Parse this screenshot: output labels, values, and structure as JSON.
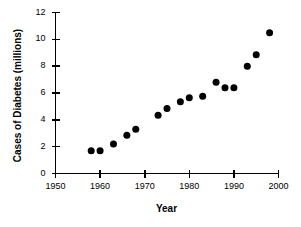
{
  "chart_data": {
    "type": "scatter",
    "title": "",
    "xlabel": "Year",
    "ylabel": "Cases of Diabetes (millions)",
    "xlim": [
      1950,
      2000
    ],
    "ylim": [
      0,
      12
    ],
    "xticks": [
      1950,
      1960,
      1970,
      1980,
      1990,
      2000
    ],
    "xticklabels": [
      "1950",
      "1960",
      "1970",
      "1980",
      "1990",
      "2000"
    ],
    "yticks": [
      0,
      2,
      4,
      6,
      8,
      10,
      12
    ],
    "yticklabels": [
      "0",
      "2",
      "4",
      "6",
      "8",
      "10",
      "12"
    ],
    "grid": false,
    "legend": null,
    "marker": {
      "shape": "circle",
      "color": "#000000",
      "size": 7
    },
    "series": [
      {
        "name": "Cases of Diabetes",
        "x": [
          1958,
          1960,
          1963,
          1966,
          1968,
          1973,
          1975,
          1978,
          1980,
          1983,
          1986,
          1988,
          1990,
          1993,
          1995,
          1998
        ],
        "y": [
          1.7,
          1.7,
          2.2,
          2.85,
          3.3,
          4.35,
          4.85,
          5.35,
          5.65,
          5.75,
          6.8,
          6.4,
          6.4,
          8.0,
          8.85,
          10.5
        ]
      }
    ]
  }
}
